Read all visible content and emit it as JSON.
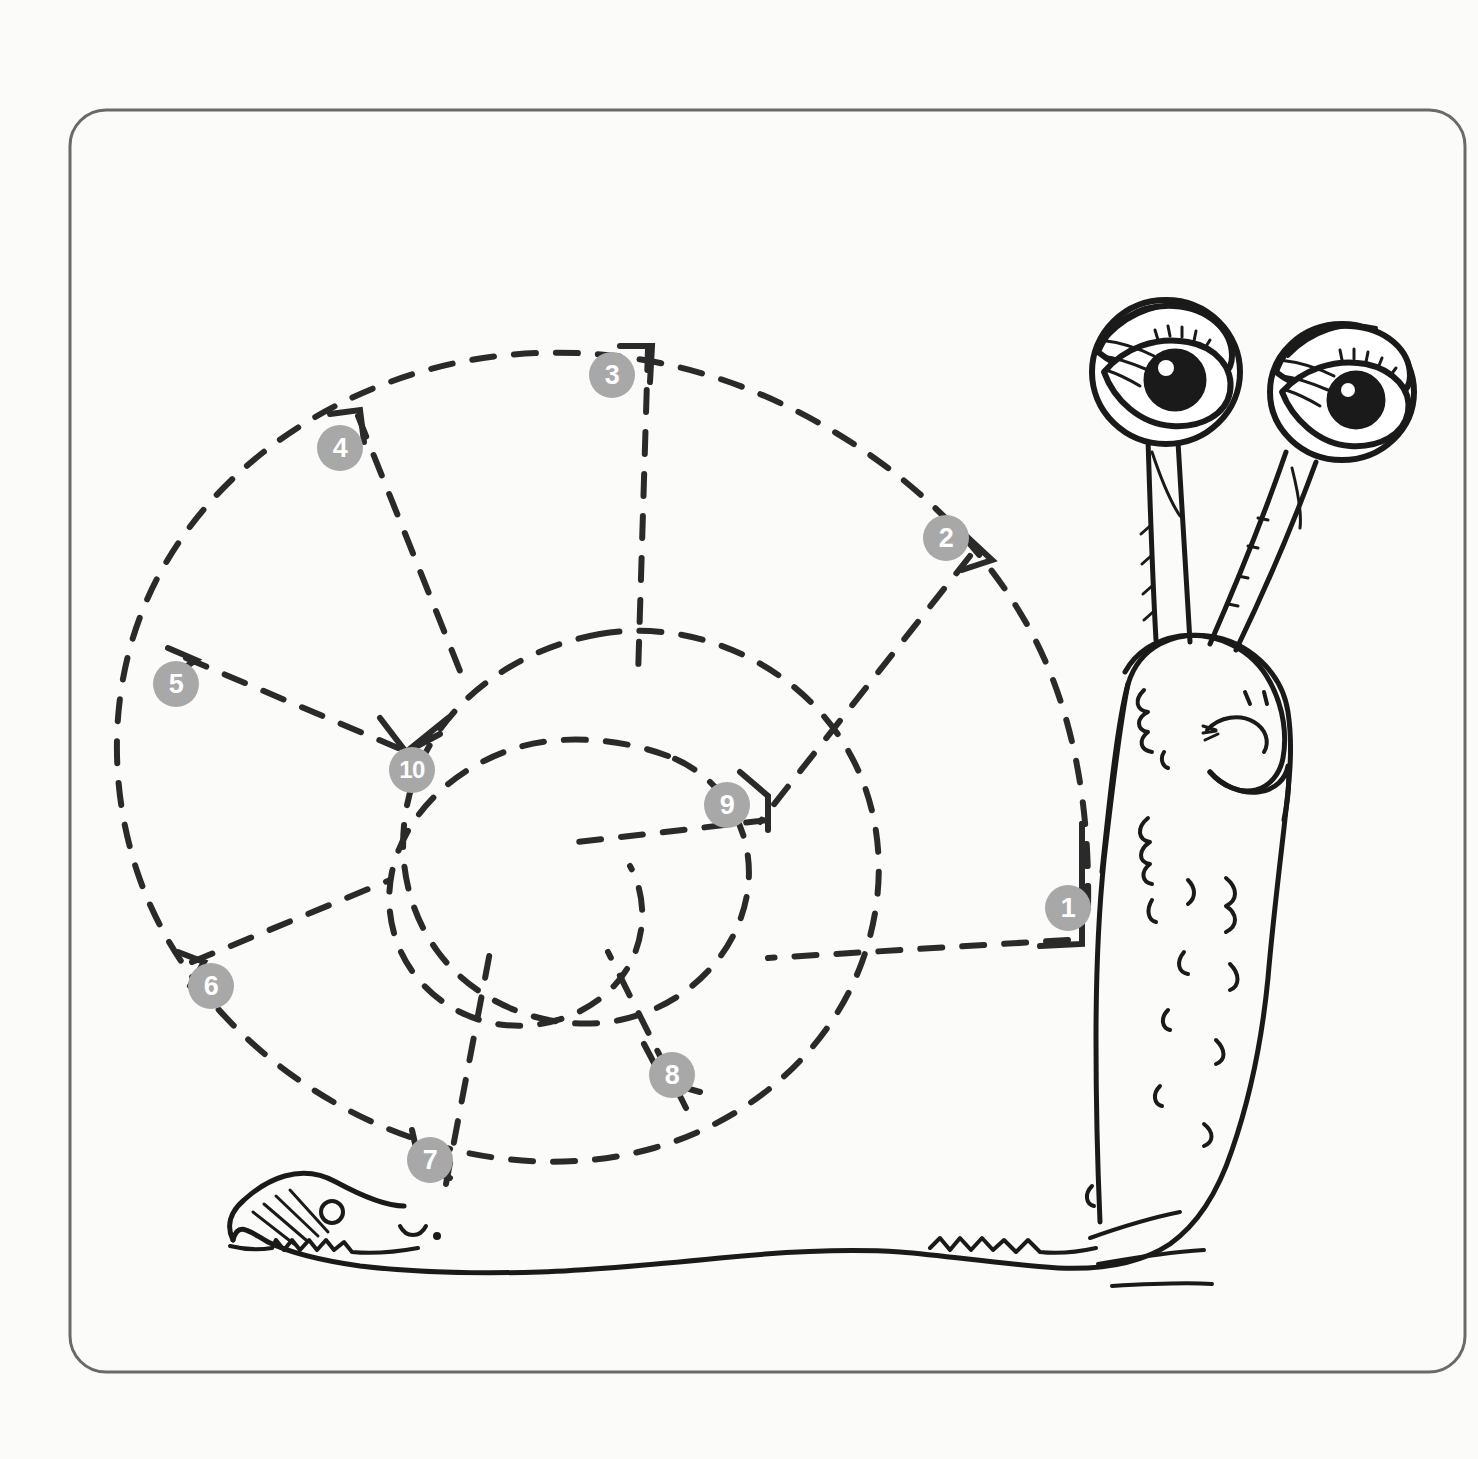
{
  "page": {
    "background_color": "#fbfbf9",
    "border_color": "#6a6a6a",
    "ink_color": "#1a1a1a",
    "marker_fill": "#a8a8a8",
    "marker_text_color": "#ffffff"
  },
  "frame": {
    "x": 70,
    "y": 110,
    "width": 1395,
    "height": 1262,
    "corner_radius": 36,
    "stroke_width": 3
  },
  "subject": {
    "name": "cartoon-snail",
    "parts": [
      "shell-spiral",
      "body",
      "head",
      "left-eyestalk",
      "right-eyestalk",
      "left-eye",
      "right-eye",
      "mouth",
      "nostrils",
      "tail",
      "foot"
    ]
  },
  "tracing": {
    "style": "dashed",
    "dash_pattern": "22 20",
    "stroke_width": 6,
    "shape": "logarithmic-spiral-shell",
    "spoke_count": 9,
    "spiral_center": {
      "x": 482,
      "y": 828
    }
  },
  "dots": [
    {
      "number": "1",
      "x": 1068,
      "y": 908
    },
    {
      "number": "2",
      "x": 946,
      "y": 538
    },
    {
      "number": "3",
      "x": 612,
      "y": 375
    },
    {
      "number": "4",
      "x": 340,
      "y": 448
    },
    {
      "number": "5",
      "x": 176,
      "y": 684
    },
    {
      "number": "6",
      "x": 211,
      "y": 986
    },
    {
      "number": "7",
      "x": 430,
      "y": 1160
    },
    {
      "number": "8",
      "x": 672,
      "y": 1075
    },
    {
      "number": "9",
      "x": 727,
      "y": 805
    },
    {
      "number": "10",
      "x": 412,
      "y": 770
    }
  ]
}
